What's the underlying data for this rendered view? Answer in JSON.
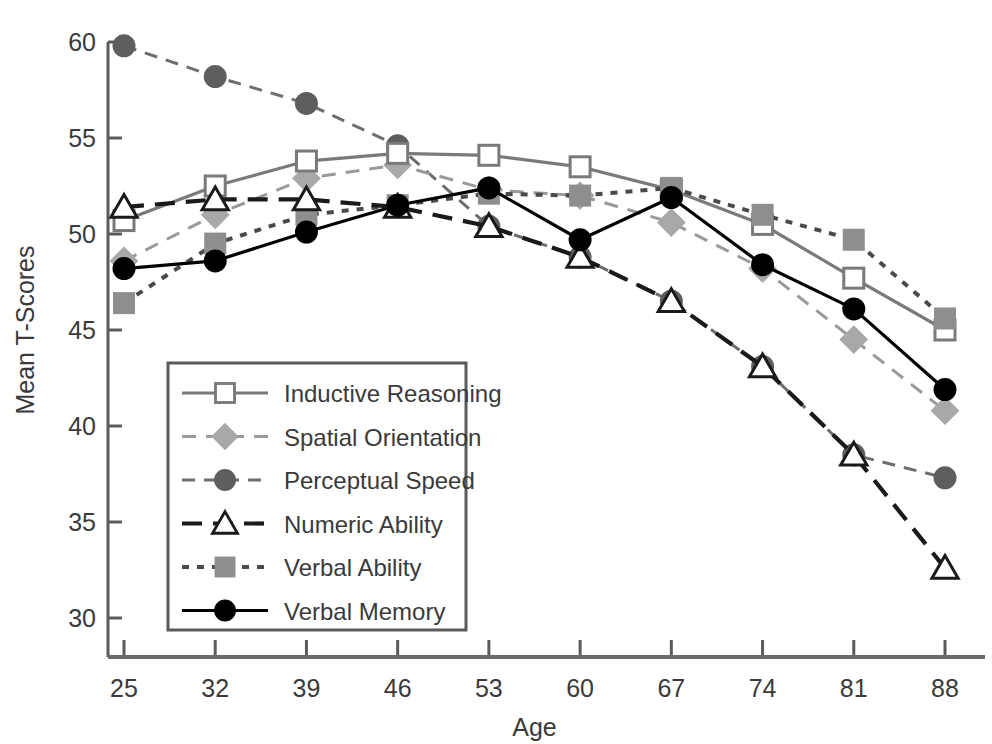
{
  "chart_data": {
    "type": "line",
    "title": "",
    "xlabel": "Age",
    "ylabel": "Mean T-Scores",
    "x": [
      25,
      32,
      39,
      46,
      53,
      60,
      67,
      74,
      81,
      88
    ],
    "categories": [
      "25",
      "32",
      "39",
      "46",
      "53",
      "60",
      "67",
      "74",
      "81",
      "88"
    ],
    "xlim": [
      25,
      88
    ],
    "ylim": [
      28.3,
      60.7
    ],
    "yticks": [
      30,
      35,
      40,
      45,
      50,
      55,
      60
    ],
    "ytick_labels": [
      "30",
      "35",
      "40",
      "45",
      "50",
      "55",
      "60"
    ],
    "grid": false,
    "legend_position": "inside-lower-left",
    "series": [
      {
        "name": "Inductive Reasoning",
        "values": [
          50.7,
          52.5,
          53.8,
          54.2,
          54.1,
          53.5,
          52.3,
          50.5,
          47.7,
          45.0
        ],
        "marker": "open-square",
        "line_style": "solid",
        "color": "#7a7a7a",
        "marker_fill": "#ffffff",
        "marker_stroke": "#7a7a7a"
      },
      {
        "name": "Spatial Orientation",
        "values": [
          48.6,
          51.0,
          52.9,
          53.6,
          52.3,
          52.0,
          50.6,
          48.2,
          44.5,
          40.8
        ],
        "marker": "diamond",
        "line_style": "dashed",
        "color": "#9a9a9a",
        "marker_fill": "#a8a8a8",
        "marker_stroke": "#a8a8a8"
      },
      {
        "name": "Perceptual Speed",
        "values": [
          59.8,
          58.2,
          56.8,
          54.6,
          50.4,
          48.8,
          46.5,
          43.1,
          38.5,
          37.3
        ],
        "marker": "filled-circle",
        "line_style": "dotted-dash",
        "color": "#6e6e6e",
        "marker_fill": "#5e5e5e",
        "marker_stroke": "#5e5e5e"
      },
      {
        "name": "Numeric Ability",
        "values": [
          51.4,
          51.8,
          51.8,
          51.4,
          50.4,
          48.8,
          46.5,
          43.1,
          38.5,
          32.6
        ],
        "marker": "open-triangle",
        "line_style": "long-dashed",
        "color": "#1a1a1a",
        "marker_fill": "#ffffff",
        "marker_stroke": "#1a1a1a"
      },
      {
        "name": "Verbal Ability",
        "values": [
          46.4,
          49.5,
          51.0,
          51.5,
          52.1,
          52.0,
          52.4,
          51.0,
          49.7,
          45.6
        ],
        "marker": "filled-square",
        "line_style": "fine-dotted",
        "color": "#4a4a4a",
        "marker_fill": "#8e8e8e",
        "marker_stroke": "#8e8e8e"
      },
      {
        "name": "Verbal Memory",
        "values": [
          48.2,
          48.6,
          50.1,
          51.5,
          52.4,
          49.7,
          51.9,
          48.4,
          46.1,
          41.9
        ],
        "marker": "filled-circle",
        "line_style": "solid",
        "color": "#000000",
        "marker_fill": "#000000",
        "marker_stroke": "#000000"
      }
    ]
  },
  "legend": {
    "items": [
      "Inductive Reasoning",
      "Spatial Orientation",
      "Perceptual Speed",
      "Numeric Ability",
      "Verbal Ability",
      "Verbal Memory"
    ]
  }
}
